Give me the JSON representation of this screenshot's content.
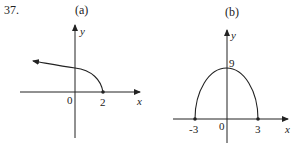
{
  "problem_number": "37.",
  "graphs": [
    {
      "id": "a",
      "label": "(a)",
      "x_axis_label": "x",
      "y_axis_label": "y",
      "origin_label": "0",
      "x_tick_labels": [
        "2"
      ],
      "curve": "y = sqrt(2 - x), arrow continuing left, endpoint at (2,0)"
    },
    {
      "id": "b",
      "label": "(b)",
      "x_axis_label": "x",
      "y_axis_label": "y",
      "origin_label": "0",
      "x_tick_labels": [
        "-3",
        "3"
      ],
      "y_tick_labels": [
        "9"
      ],
      "curve": "upper semi-ellipse from (-3,0) to (3,0) with peak at (0,9)"
    }
  ],
  "colors": {
    "stroke": "#222222",
    "background": "#ffffff"
  }
}
